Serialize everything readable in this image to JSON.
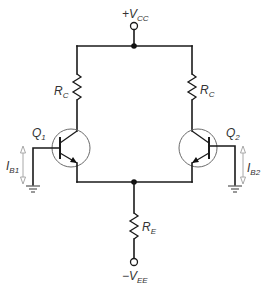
{
  "diagram": {
    "type": "differential-amplifier-circuit",
    "supply_positive": {
      "sign": "+",
      "main": "V",
      "sub": "CC"
    },
    "supply_negative": {
      "sign": "−",
      "main": "V",
      "sub": "EE"
    },
    "resistors": {
      "rc_left": {
        "main": "R",
        "sub": "C"
      },
      "rc_right": {
        "main": "R",
        "sub": "C"
      },
      "re": {
        "main": "R",
        "sub": "E"
      }
    },
    "transistors": {
      "q1": {
        "main": "Q",
        "sub": "1"
      },
      "q2": {
        "main": "Q",
        "sub": "2"
      }
    },
    "currents": {
      "ib1": {
        "main": "I",
        "sub": "B1"
      },
      "ib2": {
        "main": "I",
        "sub": "B2"
      }
    },
    "colors": {
      "wire": "#1a1a1a",
      "transistor_envelope": "#6b6b6b",
      "current_arrow": "#a8a8a8",
      "label": "#333333"
    }
  }
}
